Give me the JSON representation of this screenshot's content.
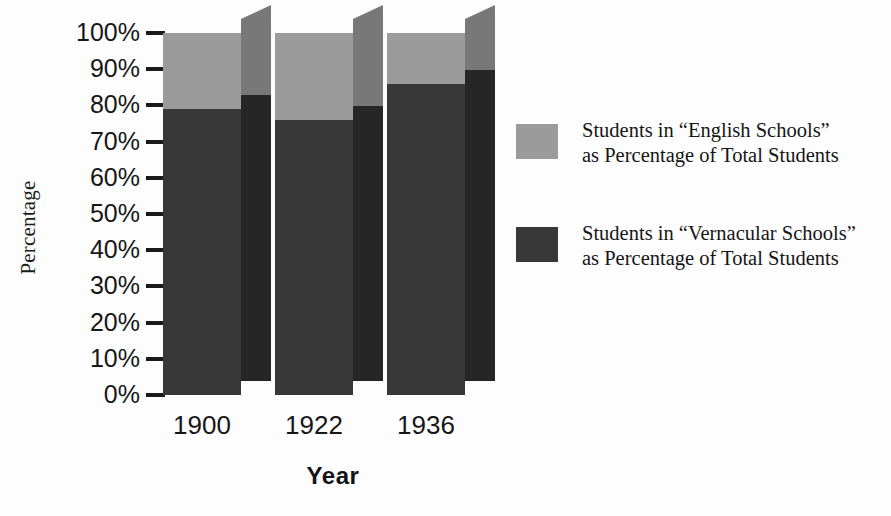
{
  "chart_data": {
    "type": "bar",
    "subtype": "stacked-100-percent-3d",
    "title": "",
    "xlabel": "Year",
    "ylabel": "Percentage",
    "categories": [
      "1900",
      "1922",
      "1936"
    ],
    "ylim": [
      0,
      100
    ],
    "ytick_labels": [
      "100%",
      "90%",
      "80%",
      "70%",
      "60%",
      "50%",
      "40%",
      "30%",
      "20%",
      "10%",
      "0%"
    ],
    "ytick_values": [
      100,
      90,
      80,
      70,
      60,
      50,
      40,
      30,
      20,
      10,
      0
    ],
    "grid": false,
    "legend_position": "right",
    "series": [
      {
        "name": "Students in “Vernacular Schools” as Percentage of Total Students",
        "values": [
          79,
          76,
          86
        ],
        "color": "#383838",
        "side_color": "#262626"
      },
      {
        "name": "Students in “English Schools” as Percentage of Total Students",
        "values": [
          21,
          24,
          14
        ],
        "color": "#9b9b9b",
        "side_color": "#787878"
      }
    ]
  },
  "axes": {
    "y_title": "Percentage",
    "x_title": "Year",
    "y_ticks": [
      {
        "label": "100%",
        "value": 100
      },
      {
        "label": "90%",
        "value": 90
      },
      {
        "label": "80%",
        "value": 80
      },
      {
        "label": "70%",
        "value": 70
      },
      {
        "label": "60%",
        "value": 60
      },
      {
        "label": "50%",
        "value": 50
      },
      {
        "label": "40%",
        "value": 40
      },
      {
        "label": "30%",
        "value": 30
      },
      {
        "label": "20%",
        "value": 20
      },
      {
        "label": "10%",
        "value": 10
      },
      {
        "label": "0%",
        "value": 0
      }
    ],
    "x_ticks": [
      {
        "label": "1900"
      },
      {
        "label": "1922"
      },
      {
        "label": "1936"
      }
    ]
  },
  "legend": {
    "entries": [
      {
        "swatch_color": "#9b9b9b",
        "line1": "Students in “English Schools”",
        "line2": "as Percentage of Total Students"
      },
      {
        "swatch_color": "#383838",
        "line1": "Students in “Vernacular Schools”",
        "line2": "as Percentage of Total Students"
      }
    ]
  },
  "colors": {
    "background": "#fdfdfd",
    "light_series": "#9b9b9b",
    "light_series_side": "#787878",
    "dark_series": "#383838",
    "dark_series_side": "#262626",
    "axis": "#1a1a1a",
    "text": "#171717"
  }
}
